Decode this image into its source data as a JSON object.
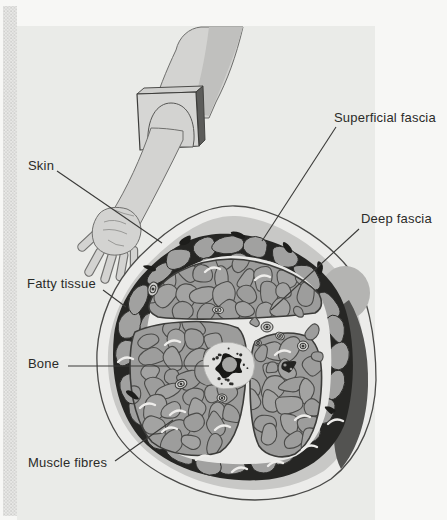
{
  "figure": {
    "labels": {
      "skin": "Skin",
      "superficial_fascia": "Superficial fascia",
      "deep_fascia": "Deep fascia",
      "fatty_tissue": "Fatty tissue",
      "bone": "Bone",
      "muscle_fibres": "Muscle fibres"
    },
    "colors": {
      "page_background": "#f7f7f5",
      "figure_wash": "#eaebe8",
      "arm_fill": "#d3d3d1",
      "outline": "#4a4a48",
      "superficial_fascia_band": "#c8c8c6",
      "fatty_lobule": "#a1a1a0",
      "fatty_crevice": "#262624",
      "deep_fascia": "#e9e9e7",
      "muscle_fill": "#9c9c9b",
      "bone_halo": "#e0e0de",
      "bone_cortex": "#181816",
      "bone_medulla": "#a6a6a4",
      "shadow_crescent": "#535351"
    }
  }
}
